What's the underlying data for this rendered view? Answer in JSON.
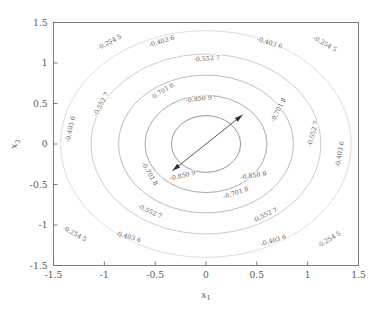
{
  "figure": {
    "background_color": "#ffffff",
    "axis_color": "#6f6f6f",
    "text_color": "#5a5a5a"
  },
  "chart_data": {
    "type": "contour",
    "title": "",
    "subtitle": "",
    "xlabel": "x",
    "xlabel_sub": "1",
    "ylabel": "x",
    "ylabel_sub": "2",
    "xlim": [
      -1.5,
      1.5
    ],
    "ylim": [
      -1.5,
      1.5
    ],
    "xticks": [
      "-1.5",
      "-1",
      "-0.5",
      "0",
      "0.5",
      "1",
      "1.5"
    ],
    "xtick_values": [
      -1.5,
      -1,
      -0.5,
      0,
      0.5,
      1,
      1.5
    ],
    "yticks": [
      "-1.5",
      "-1",
      "-0.5",
      "0",
      "0.5",
      "1",
      "1.5"
    ],
    "ytick_values": [
      -1.5,
      -1,
      -0.5,
      0,
      0.5,
      1,
      1.5
    ],
    "grid": false,
    "legend": null,
    "levels": [
      -0.2545,
      -0.4036,
      -0.5527,
      -0.7018,
      -0.8509
    ],
    "level_labels": [
      "-0.254 5",
      "-0.403 6",
      "-0.552 7",
      "-0.701 8",
      "-0.850 9"
    ],
    "level_colors": [
      "#cfcfcf",
      "#b5b5b5",
      "#9d9d9d",
      "#858585",
      "#6e6e6e"
    ],
    "contours": [
      {
        "label": "-0.254 5",
        "value": -0.2545,
        "color": "#cfcfcf",
        "semi_x": 1.43,
        "semi_y": 1.4,
        "center_x": 0.0,
        "center_y": 0.0,
        "tilt_deg": 0
      },
      {
        "label": "-0.403 6",
        "value": -0.4036,
        "color": "#b9b9b9",
        "semi_x": 1.13,
        "semi_y": 1.11,
        "center_x": 0.0,
        "center_y": 0.0,
        "tilt_deg": 0
      },
      {
        "label": "-0.552 7",
        "value": -0.5527,
        "color": "#a2a2a2",
        "semi_x": 0.86,
        "semi_y": 0.85,
        "center_x": 0.0,
        "center_y": 0.0,
        "tilt_deg": 0
      },
      {
        "label": "-0.701 8",
        "value": -0.7018,
        "color": "#8a8a8a",
        "semi_x": 0.6,
        "semi_y": 0.6,
        "center_x": 0.0,
        "center_y": 0.0,
        "tilt_deg": 0
      },
      {
        "label": "-0.850 9",
        "value": -0.8509,
        "color": "#6f6f6f",
        "semi_x": 0.34,
        "semi_y": 0.35,
        "center_x": 0.0,
        "center_y": 0.0,
        "tilt_deg": 0
      }
    ],
    "annotations": [
      {
        "name": "double-headed-arrow",
        "type": "arrow",
        "double_headed": true,
        "from_x": -0.33,
        "from_y": -0.33,
        "to_x": 0.36,
        "to_y": 0.36
      }
    ],
    "contour_label_placements": [
      {
        "text": "-0.254 5",
        "x": -0.94,
        "y": 1.235,
        "rot": -27
      },
      {
        "text": "-0.254 5",
        "x": 1.16,
        "y": 1.215,
        "rot": 30
      },
      {
        "text": "-0.254 5",
        "x": -1.3,
        "y": -1.13,
        "rot": 28
      },
      {
        "text": "-0.254 5",
        "x": 1.22,
        "y": -1.2,
        "rot": -31
      },
      {
        "text": "-0.403 6",
        "x": -0.43,
        "y": 1.245,
        "rot": -17
      },
      {
        "text": "-0.403 6",
        "x": 0.62,
        "y": 1.225,
        "rot": 17
      },
      {
        "text": "-0.403 6",
        "x": -0.77,
        "y": -1.17,
        "rot": 16
      },
      {
        "text": "-0.403 6",
        "x": 0.67,
        "y": -1.215,
        "rot": -17
      },
      {
        "text": "-0.403 6",
        "x": -1.315,
        "y": 0.18,
        "rot": -78
      },
      {
        "text": "-0.403 6",
        "x": 1.335,
        "y": -0.13,
        "rot": -80
      },
      {
        "text": "-0.552 7",
        "x": 0.01,
        "y": 1.03,
        "rot": -4
      },
      {
        "text": "-0.552 7",
        "x": -1.015,
        "y": 0.48,
        "rot": -62
      },
      {
        "text": "-0.552 7",
        "x": 1.07,
        "y": 0.12,
        "rot": -74
      },
      {
        "text": "-0.552 7",
        "x": -0.56,
        "y": -0.855,
        "rot": 25
      },
      {
        "text": "-0.552 7",
        "x": 0.59,
        "y": -0.9,
        "rot": -26
      },
      {
        "text": "-0.701 8",
        "x": -0.42,
        "y": 0.63,
        "rot": -32
      },
      {
        "text": "-0.701 8",
        "x": 0.73,
        "y": 0.41,
        "rot": -63
      },
      {
        "text": "-0.701 8",
        "x": -0.57,
        "y": -0.38,
        "rot": 60
      },
      {
        "text": "-0.701 8",
        "x": 0.3,
        "y": -0.625,
        "rot": -19
      },
      {
        "text": "-0.850 9",
        "x": -0.07,
        "y": 0.535,
        "rot": -6
      },
      {
        "text": "-0.850 9",
        "x": -0.225,
        "y": -0.415,
        "rot": -13
      },
      {
        "text": "-0.850 9",
        "x": 0.47,
        "y": -0.415,
        "rot": -8
      }
    ]
  }
}
